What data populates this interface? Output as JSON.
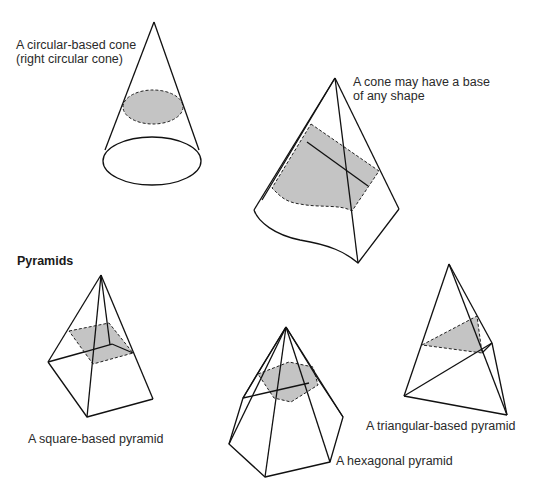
{
  "figure": {
    "shading_color": "#c4c4c4",
    "line_color": "#111111"
  },
  "labels": {
    "circular_cone_line1": "A circular-based cone",
    "circular_cone_line2": "(right circular cone)",
    "any_base_line1": "A cone may have a base",
    "any_base_line2": "of any shape",
    "pyramids_heading": "Pyramids",
    "square_pyramid": "A square-based pyramid",
    "hexagonal_pyramid": "A hexagonal pyramid",
    "triangular_pyramid": "A triangular-based pyramid"
  },
  "shapes": [
    {
      "name": "circular-cone",
      "caption_key": "circular_cone_line1"
    },
    {
      "name": "irregular-cone",
      "caption_key": "any_base_line1"
    },
    {
      "name": "square-pyramid",
      "caption_key": "square_pyramid"
    },
    {
      "name": "hexagonal-pyramid",
      "caption_key": "hexagonal_pyramid"
    },
    {
      "name": "triangular-pyramid",
      "caption_key": "triangular_pyramid"
    }
  ]
}
